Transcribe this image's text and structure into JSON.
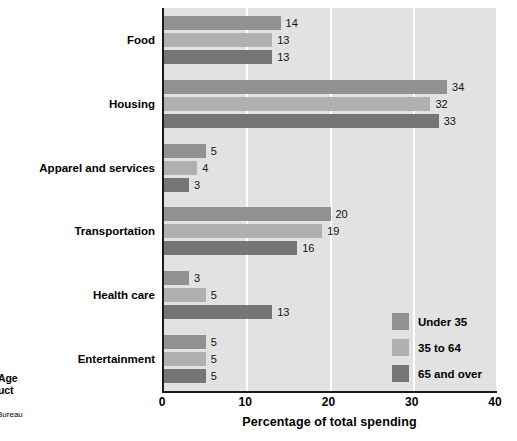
{
  "caption": {
    "line1": "Age",
    "line2": "uct",
    "source": "Bureau"
  },
  "chart_data": {
    "type": "bar",
    "orientation": "horizontal",
    "title": "",
    "xlabel": "Percentage of total spending",
    "ylabel": "",
    "xlim": [
      0,
      40
    ],
    "xticks": [
      0,
      10,
      20,
      30,
      40
    ],
    "grid": true,
    "legend_position": "lower-right",
    "categories": [
      "Food",
      "Housing",
      "Apparel and services",
      "Transportation",
      "Health care",
      "Entertainment"
    ],
    "series": [
      {
        "name": "Under 35",
        "color": "#919191",
        "values": [
          14,
          34,
          5,
          20,
          3,
          5
        ]
      },
      {
        "name": "35 to 64",
        "color": "#b0b0b0",
        "values": [
          13,
          32,
          4,
          19,
          5,
          5
        ]
      },
      {
        "name": "65 and over",
        "color": "#757575",
        "values": [
          13,
          33,
          3,
          16,
          13,
          5
        ]
      }
    ]
  },
  "style": {
    "plot_background": "#e2e2e2",
    "gridline_color": "#ffffff",
    "axis_color": "#1a1a1a"
  }
}
